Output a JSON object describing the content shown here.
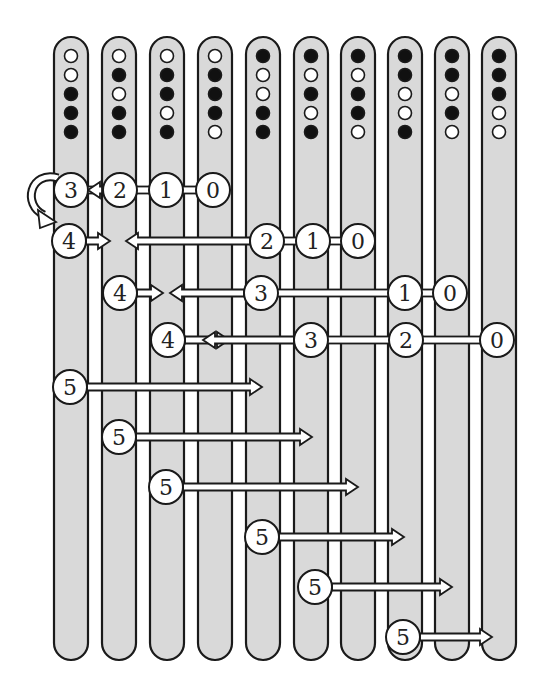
{
  "diagram": {
    "colors": {
      "column_fill": "#d9d9d9",
      "stroke": "#1a1a1a",
      "dot_black": "#111111",
      "dot_white": "#ffffff",
      "node_fill": "#ffffff",
      "background": "#ffffff"
    },
    "columns": [
      {
        "x": 71,
        "dots": [
          "W",
          "W",
          "B",
          "B",
          "B"
        ]
      },
      {
        "x": 119,
        "dots": [
          "W",
          "B",
          "W",
          "B",
          "B"
        ]
      },
      {
        "x": 167,
        "dots": [
          "W",
          "B",
          "B",
          "W",
          "B"
        ]
      },
      {
        "x": 215,
        "dots": [
          "W",
          "B",
          "B",
          "B",
          "W"
        ]
      },
      {
        "x": 263,
        "dots": [
          "B",
          "W",
          "W",
          "B",
          "B"
        ]
      },
      {
        "x": 311,
        "dots": [
          "B",
          "W",
          "B",
          "W",
          "B"
        ]
      },
      {
        "x": 358,
        "dots": [
          "B",
          "W",
          "B",
          "B",
          "W"
        ]
      },
      {
        "x": 405,
        "dots": [
          "B",
          "B",
          "W",
          "W",
          "B"
        ]
      },
      {
        "x": 452,
        "dots": [
          "B",
          "B",
          "W",
          "B",
          "W"
        ]
      },
      {
        "x": 499,
        "dots": [
          "B",
          "B",
          "B",
          "W",
          "W"
        ]
      }
    ],
    "rows": [
      {
        "y": 190,
        "nodes": [
          {
            "x": 71,
            "label": "3"
          },
          {
            "x": 120,
            "label": "2"
          },
          {
            "x": 166,
            "label": "1"
          },
          {
            "x": 213,
            "label": "0"
          }
        ],
        "left_arrow": {
          "from": 102,
          "to": 88
        },
        "self_loop": true
      },
      {
        "y": 241,
        "nodes": [
          {
            "x": 69,
            "label": "4"
          },
          {
            "x": 267,
            "label": "2"
          },
          {
            "x": 313,
            "label": "1"
          },
          {
            "x": 358,
            "label": "0"
          }
        ],
        "right_arrow": {
          "from": 86,
          "to": 110
        },
        "left_arrow": {
          "from": 250,
          "to": 126
        }
      },
      {
        "y": 293,
        "nodes": [
          {
            "x": 120,
            "label": "4"
          },
          {
            "x": 261,
            "label": "3"
          },
          {
            "x": 405,
            "label": "1"
          },
          {
            "x": 450,
            "label": "0"
          }
        ],
        "right_arrow": {
          "from": 137,
          "to": 163
        },
        "left_arrow": {
          "from": 244,
          "to": 170
        }
      },
      {
        "y": 340,
        "nodes": [
          {
            "x": 168,
            "label": "4"
          },
          {
            "x": 311,
            "label": "3"
          },
          {
            "x": 406,
            "label": "2"
          },
          {
            "x": 497,
            "label": "0"
          }
        ],
        "right_arrow": {
          "from": 185,
          "to": 229
        },
        "left_arrow": {
          "from": 294,
          "to": 203
        }
      },
      {
        "y": 387,
        "nodes": [
          {
            "x": 70,
            "label": "5"
          }
        ],
        "right_arrow": {
          "from": 87,
          "to": 262
        }
      },
      {
        "y": 437,
        "nodes": [
          {
            "x": 119,
            "label": "5"
          }
        ],
        "right_arrow": {
          "from": 136,
          "to": 312
        }
      },
      {
        "y": 487,
        "nodes": [
          {
            "x": 166,
            "label": "5"
          }
        ],
        "right_arrow": {
          "from": 183,
          "to": 358
        }
      },
      {
        "y": 537,
        "nodes": [
          {
            "x": 262,
            "label": "5"
          }
        ],
        "right_arrow": {
          "from": 279,
          "to": 404
        }
      },
      {
        "y": 587,
        "nodes": [
          {
            "x": 315,
            "label": "5"
          }
        ],
        "right_arrow": {
          "from": 332,
          "to": 452
        }
      },
      {
        "y": 637,
        "nodes": [
          {
            "x": 403,
            "label": "5"
          }
        ],
        "right_arrow": {
          "from": 420,
          "to": 492
        }
      }
    ],
    "layout": {
      "column_width": 34,
      "column_top": 37,
      "column_bottom": 660,
      "dot_y": [
        56,
        75,
        94,
        113,
        132
      ],
      "dot_r": 6.5,
      "node_r": 17
    }
  }
}
